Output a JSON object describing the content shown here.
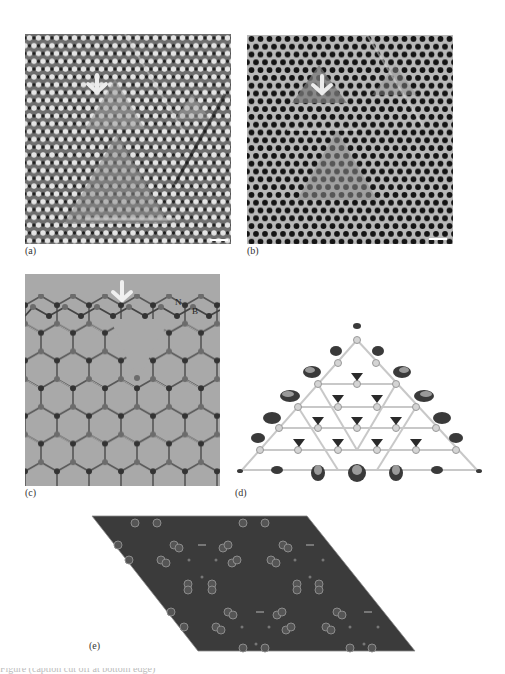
{
  "figure": {
    "panels": [
      {
        "id": "a",
        "label": "(a)",
        "type": "tem-image",
        "description": "HRTEM image of hexagonal boron nitride lattice with triangular vacancy defects",
        "arrow": "down-arrow",
        "scale_bar": true
      },
      {
        "id": "b",
        "label": "(b)",
        "type": "tem-image",
        "description": "Filtered HRTEM image of the same region, dark hexagonal lattice spots with triangular defect",
        "arrow": "down-arrow",
        "scale_bar": true
      },
      {
        "id": "c",
        "label": "(c)",
        "type": "atomic-model",
        "description": "Ball-and-stick model of h-BN lattice with triangular vacancy",
        "arrow": "down-arrow",
        "atom_labels": [
          "N",
          "B"
        ]
      },
      {
        "id": "d",
        "label": "(d)",
        "type": "charge-density",
        "description": "Triangular h-BN fragment with charge density isosurfaces"
      },
      {
        "id": "e",
        "label": "(e)",
        "type": "simulated-image",
        "description": "Simulated image in a rhombic supercell"
      }
    ],
    "colors": {
      "page_bg": "#ffffff",
      "panel_c_bg": "#a9a9a9",
      "panel_e_bg": "#3b3b3b",
      "arrow": "#e8e8e8",
      "nitrogen": "#3a3a3a",
      "boron": "#6a6a6a"
    },
    "caption_cropped": "Figure (caption cut off at bottom edge)"
  }
}
